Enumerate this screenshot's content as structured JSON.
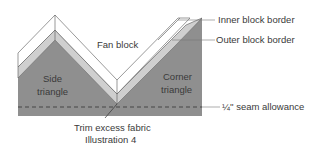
{
  "diagram": {
    "regions": {
      "fan_block": "Fan block",
      "side_triangle_line1": "Side",
      "side_triangle_line2": "triangle",
      "corner_triangle_line1": "Corner",
      "corner_triangle_line2": "triangle"
    },
    "callouts": {
      "inner_block_border": "Inner block border",
      "outer_block_border": "Outer block border",
      "seam_allowance": "¼'' seam allowance"
    },
    "caption": {
      "line1": "Trim excess fabric",
      "line2": "Illustration 4"
    },
    "colors": {
      "dark_gray": "#8f8f8f",
      "light_gray": "#cfcfcf",
      "white_band": "#ffffff",
      "stroke": "#555555",
      "label": "#3a3a3a"
    }
  }
}
